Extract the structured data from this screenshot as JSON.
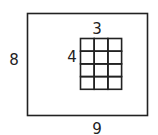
{
  "outer": {
    "width_label": "9",
    "height_label": "8"
  },
  "inner": {
    "width_label": "3",
    "height_label": "4",
    "columns": 3,
    "rows": 4
  },
  "colors": {
    "stroke": "#222222"
  }
}
